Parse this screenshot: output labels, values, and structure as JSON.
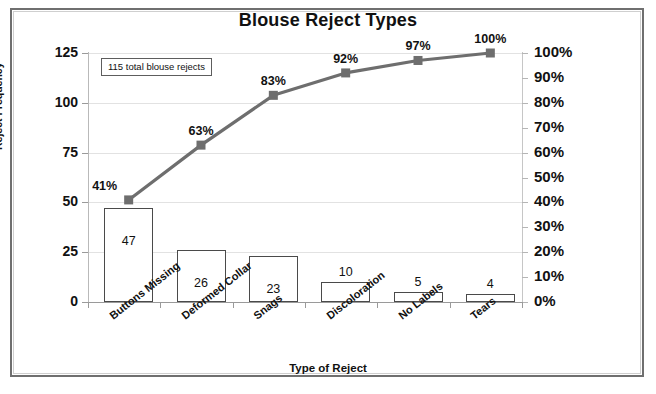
{
  "chart_data": {
    "type": "bar",
    "title": "Blouse Reject Types",
    "xlabel": "Type of Reject",
    "ylabel": "Reject Frequency",
    "y2label": "",
    "categories": [
      "Buttons Missing",
      "Deformed Collar",
      "Snags",
      "Discoloration",
      "No Labels",
      "Tears"
    ],
    "values": [
      47,
      26,
      23,
      10,
      5,
      4
    ],
    "value_labels": [
      "47",
      "26",
      "23",
      "10",
      "5",
      "4"
    ],
    "cumulative_percent": [
      41,
      63,
      83,
      92,
      97,
      100
    ],
    "cumulative_labels": [
      "41%",
      "63%",
      "83%",
      "92%",
      "97%",
      "100%"
    ],
    "ylim": [
      0,
      125
    ],
    "yticks": [
      0,
      25,
      50,
      75,
      100,
      125
    ],
    "ytick_labels": [
      "0",
      "25",
      "50",
      "75",
      "100",
      "125"
    ],
    "y2lim": [
      0,
      100
    ],
    "y2ticks": [
      0,
      10,
      20,
      30,
      40,
      50,
      60,
      70,
      80,
      90,
      100
    ],
    "y2tick_labels": [
      "0%",
      "10%",
      "20%",
      "30%",
      "40%",
      "50%",
      "60%",
      "70%",
      "80%",
      "90%",
      "100%"
    ],
    "annotation": "115 total blouse rejects",
    "grid": true,
    "legend": "none",
    "series": [
      {
        "name": "Reject Frequency",
        "type": "bar",
        "values": [
          47,
          26,
          23,
          10,
          5,
          4
        ]
      },
      {
        "name": "Cumulative Percent",
        "type": "line",
        "values": [
          41,
          63,
          83,
          92,
          97,
          100
        ]
      }
    ],
    "colors": {
      "bar_fill": "#ffffff",
      "bar_edge": "#4a4a4a",
      "line": "#6e6e6e",
      "marker": "#6e6e6e",
      "grid": "#e2e2e2",
      "text": "#111111",
      "frame": "#6f6f6f"
    }
  }
}
